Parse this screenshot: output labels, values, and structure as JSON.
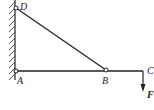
{
  "diagram": {
    "type": "statics-truss-bracket",
    "labels": {
      "D": "D",
      "A": "A",
      "B": "B",
      "C": "C",
      "F": "F"
    }
  }
}
